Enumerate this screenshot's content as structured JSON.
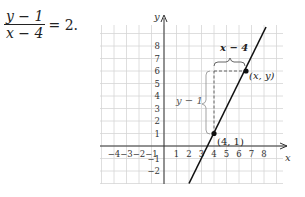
{
  "equation": {
    "numerator": "y − 1",
    "denominator": "x − 4",
    "rhs": "= 2."
  },
  "graph": {
    "x_axis_label": "x",
    "y_axis_label": "y",
    "x_ticks": [
      "−4",
      "−3",
      "−2",
      "−1",
      "1",
      "2",
      "3",
      "4",
      "5",
      "6",
      "7",
      "8"
    ],
    "y_ticks": [
      "8",
      "7",
      "6",
      "5",
      "4",
      "3",
      "2",
      "1",
      "−1",
      "−2"
    ],
    "horizontal_brace_label": "x − 4",
    "vertical_brace_label": "y − 1",
    "point_a_label": "(4, 1)",
    "point_b_label": "(x, y)"
  },
  "chart_data": {
    "type": "line",
    "title": "",
    "xlabel": "x",
    "ylabel": "y",
    "xlim": [
      -5,
      9
    ],
    "ylim": [
      -3,
      9
    ],
    "grid": true,
    "series": [
      {
        "name": "y - 1 = 2(x - 4)",
        "x": [
          2,
          7.5
        ],
        "y": [
          -3,
          8
        ]
      }
    ],
    "points": [
      {
        "label": "(4, 1)",
        "x": 4,
        "y": 1
      },
      {
        "label": "(x, y)",
        "x": 6.5,
        "y": 6
      }
    ],
    "annotations": [
      {
        "text": "x − 4",
        "type": "horizontal brace from x=4 to x=6.5 at y=6"
      },
      {
        "text": "y − 1",
        "type": "vertical brace from y=1 to y=6 at x=4"
      }
    ]
  }
}
